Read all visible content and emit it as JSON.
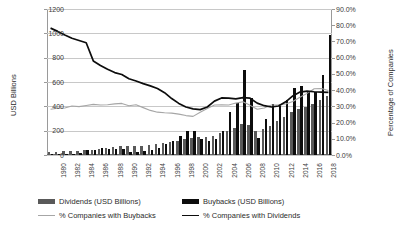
{
  "chart_data": {
    "type": "bar",
    "title": "",
    "subtitle": "",
    "xlabel": "",
    "ylabel": "USD Billions",
    "ylabel_secondary": "Percentage of Companies",
    "grid": true,
    "legend_position": "bottom",
    "ylim": [
      0,
      1200
    ],
    "ylim_secondary": [
      0,
      0.9
    ],
    "yticks": [
      "0",
      "200",
      "400",
      "600",
      "800",
      "1000",
      "1200"
    ],
    "ytick_values": [
      0,
      200,
      400,
      600,
      800,
      1000,
      1200
    ],
    "yticks_secondary": [
      "0.0%",
      "10.0%",
      "20.0%",
      "30.0%",
      "40.0%",
      "50.0%",
      "60.0%",
      "70.0%",
      "80.0%",
      "90.0%"
    ],
    "ytick_values_secondary": [
      0,
      10,
      20,
      30,
      40,
      50,
      60,
      70,
      80,
      90
    ],
    "categories": [
      1980,
      1981,
      1982,
      1983,
      1984,
      1985,
      1986,
      1987,
      1988,
      1989,
      1990,
      1991,
      1992,
      1993,
      1994,
      1995,
      1996,
      1997,
      1998,
      1999,
      2000,
      2001,
      2002,
      2003,
      2004,
      2005,
      2006,
      2007,
      2008,
      2009,
      2010,
      2011,
      2012,
      2013,
      2014,
      2015,
      2016,
      2017,
      2018,
      2019
    ],
    "xtick_labels": [
      "1980",
      "1982",
      "1984",
      "1986",
      "1988",
      "1990",
      "1992",
      "1994",
      "1996",
      "1998",
      "2000",
      "2002",
      "2004",
      "2006",
      "2008",
      "2010",
      "2012",
      "2014",
      "2016",
      "2018"
    ],
    "series": [
      {
        "name": "Dividends (USD Billions)",
        "axis": "left",
        "type": "bar",
        "color": "#595959",
        "values": [
          26,
          28,
          30,
          33,
          36,
          40,
          45,
          52,
          58,
          64,
          70,
          72,
          74,
          78,
          84,
          92,
          100,
          108,
          118,
          128,
          140,
          148,
          150,
          160,
          181,
          196,
          225,
          252,
          248,
          196,
          212,
          240,
          280,
          310,
          350,
          382,
          396,
          420,
          456,
          485
        ]
      },
      {
        "name": "Buybacks (USD Billions)",
        "axis": "left",
        "type": "bar",
        "color": "#0d0d0d",
        "values": [
          5,
          6,
          8,
          10,
          14,
          40,
          42,
          55,
          48,
          52,
          48,
          22,
          24,
          32,
          38,
          60,
          88,
          118,
          160,
          198,
          196,
          134,
          118,
          130,
          200,
          350,
          430,
          700,
          470,
          140,
          300,
          420,
          400,
          450,
          550,
          570,
          530,
          520,
          660,
          990
        ]
      },
      {
        "name": "% Companies with Buybacks",
        "axis": "right",
        "type": "line",
        "color": "#a6a6a6",
        "values": [
          28.2,
          28.8,
          29.0,
          30.2,
          29.8,
          30.5,
          31.2,
          30.8,
          31.0,
          31.5,
          31.8,
          30.4,
          31.0,
          29.2,
          27.5,
          26.4,
          26.0,
          25.8,
          25.2,
          24.3,
          23.8,
          26.4,
          28.6,
          30.8,
          31.0,
          30.8,
          32.0,
          32.8,
          30.6,
          28.2,
          29.0,
          30.8,
          31.0,
          31.5,
          33.0,
          35.6,
          38.0,
          40.8,
          41.0,
          39.8
        ]
      },
      {
        "name": "% Companies with Dividends",
        "axis": "right",
        "type": "line",
        "color": "#0d0d0d",
        "values": [
          78.2,
          76.2,
          74.0,
          72.0,
          70.6,
          69.2,
          58.0,
          55.2,
          52.8,
          50.8,
          49.6,
          47.0,
          45.6,
          44.0,
          42.6,
          41.0,
          38.4,
          34.8,
          31.8,
          29.6,
          28.4,
          28.0,
          29.6,
          33.2,
          35.2,
          35.0,
          34.6,
          35.4,
          35.0,
          32.0,
          30.4,
          29.6,
          30.2,
          32.8,
          36.4,
          38.8,
          39.4,
          39.0,
          38.8,
          38.6
        ]
      }
    ],
    "legend": [
      {
        "label": "Dividends (USD Billions)",
        "marker": "bar",
        "color": "#595959"
      },
      {
        "label": "Buybacks (USD Billions)",
        "marker": "bar",
        "color": "#0d0d0d"
      },
      {
        "label": "% Companies with Buybacks",
        "marker": "line",
        "color": "#a6a6a6"
      },
      {
        "label": "% Companies with Dividends",
        "marker": "line",
        "color": "#0d0d0d"
      }
    ]
  }
}
